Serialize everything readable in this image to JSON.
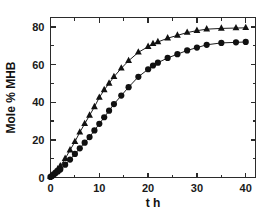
{
  "chart_data": {
    "type": "scatter",
    "title": "",
    "subtitle": "",
    "xlabel": "t h",
    "ylabel": "Mole % MHB",
    "xlim": [
      0,
      42
    ],
    "ylim": [
      0,
      85
    ],
    "grid": false,
    "legend_position": "none",
    "x_ticks": [
      0,
      10,
      20,
      30,
      40
    ],
    "x_tick_labels": [
      "0",
      "10",
      "20",
      "30",
      "40"
    ],
    "x_minor_ticks": [
      5,
      15,
      25,
      35
    ],
    "y_ticks": [
      0,
      20,
      40,
      60,
      80
    ],
    "y_tick_labels": [
      "0",
      "20",
      "40",
      "60",
      "80"
    ],
    "y_minor_ticks": [
      10,
      30,
      50,
      70
    ],
    "series": [
      {
        "name": "triangle-series",
        "marker": "triangle",
        "color": "#111111",
        "x": [
          0.0,
          0.3,
          0.6,
          1.0,
          1.5,
          2.0,
          3.0,
          4.0,
          5.0,
          6.0,
          7.0,
          8.0,
          9.0,
          10.0,
          11.0,
          12.0,
          13.0,
          14.5,
          16.0,
          18.0,
          20.0,
          21.0,
          22.0,
          24.0,
          26.0,
          28.0,
          30.0,
          32.0,
          35.0,
          38.0,
          40.0
        ],
        "values": [
          0.5,
          1.2,
          2.0,
          3.0,
          4.5,
          6.0,
          10.0,
          14.5,
          19.0,
          24.0,
          28.5,
          33.0,
          37.5,
          42.5,
          46.5,
          50.0,
          53.5,
          58.0,
          62.0,
          66.5,
          69.5,
          71.0,
          72.0,
          74.0,
          75.5,
          77.0,
          78.0,
          78.8,
          79.2,
          79.4,
          79.5
        ]
      },
      {
        "name": "circle-series",
        "marker": "circle",
        "color": "#111111",
        "x": [
          0.0,
          0.3,
          0.6,
          1.0,
          1.5,
          2.0,
          3.0,
          4.0,
          5.0,
          6.0,
          7.0,
          8.0,
          9.0,
          10.0,
          11.0,
          12.0,
          13.0,
          14.5,
          16.0,
          18.0,
          20.0,
          21.0,
          22.0,
          24.0,
          26.0,
          28.0,
          30.0,
          32.0,
          35.0,
          38.0,
          40.0
        ],
        "values": [
          0.3,
          0.8,
          1.4,
          2.2,
          3.2,
          4.2,
          6.8,
          9.5,
          12.5,
          15.5,
          18.5,
          21.5,
          25.0,
          28.5,
          32.0,
          35.5,
          39.0,
          43.5,
          48.0,
          53.5,
          57.5,
          59.5,
          61.0,
          63.5,
          65.5,
          67.5,
          69.0,
          70.5,
          71.5,
          71.8,
          72.0
        ]
      }
    ]
  }
}
